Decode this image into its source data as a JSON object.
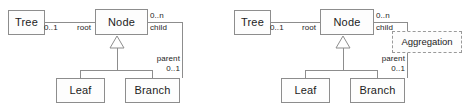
{
  "figure": {
    "kind": "uml-class-diagram-pair",
    "background_color": "#ffffff",
    "line_color": "#8d8d8d",
    "text_color": "#1c1c1c",
    "note_border_style": "dashed"
  },
  "diagrams": [
    {
      "id": "left",
      "name": "composite-pattern-without-annotation",
      "classes": {
        "tree": "Tree",
        "node": "Node",
        "leaf": "Leaf",
        "branch": "Branch"
      },
      "association_root": {
        "source_multiplicity": "0..1",
        "role_name": "root"
      },
      "association_child": {
        "child_multiplicity": "0..n",
        "child_role": "child",
        "parent_role": "parent",
        "parent_multiplicity": "0..1"
      },
      "generalization": {
        "parent": "Node",
        "children": [
          "Leaf",
          "Branch"
        ]
      },
      "note": null
    },
    {
      "id": "right",
      "name": "composite-pattern-with-aggregation-note",
      "classes": {
        "tree": "Tree",
        "node": "Node",
        "leaf": "Leaf",
        "branch": "Branch"
      },
      "association_root": {
        "source_multiplicity": "0..1",
        "role_name": "root"
      },
      "association_child": {
        "child_multiplicity": "0..n",
        "child_role": "child",
        "parent_role": "parent",
        "parent_multiplicity": "0..1"
      },
      "generalization": {
        "parent": "Node",
        "children": [
          "Leaf",
          "Branch"
        ]
      },
      "note": {
        "label": "Aggregation",
        "attached_to": "child-association"
      }
    }
  ]
}
